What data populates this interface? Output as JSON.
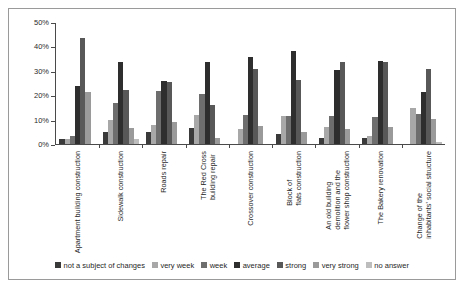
{
  "chart_data": {
    "type": "bar",
    "title": "",
    "xlabel": "",
    "ylabel": "",
    "ylim": [
      0,
      50
    ],
    "ytick_labels": [
      "0%",
      "10%",
      "20%",
      "30%",
      "40%",
      "50%"
    ],
    "ytick_values": [
      0,
      10,
      20,
      30,
      40,
      50
    ],
    "grid": false,
    "legend_position": "bottom",
    "categories": [
      "Apartment building construction",
      "Sidewalk construction",
      "Roads repair",
      "The Red Cross building repair",
      "Crossover construction",
      "Block of flats construction",
      "An old building demolition and the flower shop construction",
      "The Bakery renovation",
      "Change of the inhabitants' social structure"
    ],
    "series": [
      {
        "name": "not a subject of changes",
        "color": "#3a3a3a",
        "values": [
          2,
          5,
          5,
          6.5,
          0,
          4,
          2.5,
          2.5,
          0
        ]
      },
      {
        "name": "very week",
        "color": "#a8a8a8",
        "values": [
          2,
          10,
          8,
          12,
          6,
          11.5,
          7,
          3.5,
          15
        ]
      },
      {
        "name": "week",
        "color": "#6e6e6e",
        "values": [
          3.5,
          17,
          22,
          20.5,
          12,
          11.5,
          11.5,
          11,
          12.5
        ]
      },
      {
        "name": "average",
        "color": "#2e2e2e",
        "values": [
          24,
          34,
          26,
          34,
          36,
          38.5,
          30.5,
          34.5,
          21.5
        ]
      },
      {
        "name": "strong",
        "color": "#585858",
        "values": [
          44,
          22.5,
          25.5,
          16,
          31,
          26.5,
          34,
          34,
          31
        ]
      },
      {
        "name": "very strong",
        "color": "#9a9a9a",
        "values": [
          21.5,
          6.5,
          9,
          2.5,
          7.5,
          5,
          6,
          7,
          10.5
        ]
      },
      {
        "name": "no answer",
        "color": "#bdbdbd",
        "values": [
          0,
          2,
          0,
          0,
          0,
          0,
          0,
          0,
          1
        ]
      }
    ]
  }
}
